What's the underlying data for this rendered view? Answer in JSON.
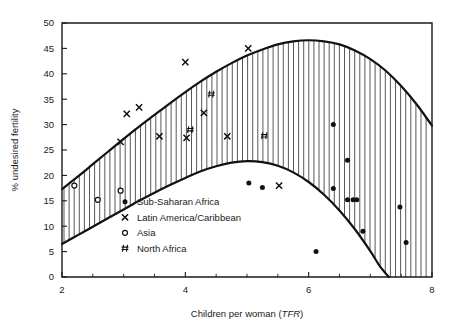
{
  "chart_data": {
    "type": "scatter",
    "title": "",
    "xlabel": "Children per woman (TFR)",
    "xlabel_plain": "Children per woman (",
    "xlabel_italic": "TFR",
    "xlabel_close": ")",
    "ylabel": "% undesired fertility",
    "xlim": [
      2,
      8
    ],
    "ylim": [
      0,
      50
    ],
    "xticks": [
      2,
      4,
      6,
      8
    ],
    "xticklabels": [
      "2",
      "4",
      "6",
      "8"
    ],
    "xminorticks": [
      2.5,
      3,
      3.5,
      4.5,
      5,
      5.5,
      6.5,
      7,
      7.5
    ],
    "yticks": [
      0,
      5,
      10,
      15,
      20,
      25,
      30,
      35,
      40,
      45,
      50
    ],
    "yticklabels": [
      "0",
      "5",
      "10",
      "15",
      "20",
      "25",
      "30",
      "35",
      "40",
      "45",
      "50"
    ],
    "grid": false,
    "legend_position": "inside-lower-left",
    "band": {
      "description": "Hatched band between an upper and a lower fitted curve of % undesired fertility vs TFR",
      "fill": "vertical-hatch",
      "upper_curve": [
        {
          "x": 2.0,
          "y": 17.3
        },
        {
          "x": 2.25,
          "y": 19.7
        },
        {
          "x": 2.5,
          "y": 22.2
        },
        {
          "x": 2.75,
          "y": 24.7
        },
        {
          "x": 3.0,
          "y": 27.2
        },
        {
          "x": 3.25,
          "y": 29.6
        },
        {
          "x": 3.5,
          "y": 31.9
        },
        {
          "x": 3.75,
          "y": 34.2
        },
        {
          "x": 4.0,
          "y": 36.4
        },
        {
          "x": 4.25,
          "y": 38.5
        },
        {
          "x": 4.5,
          "y": 40.4
        },
        {
          "x": 4.75,
          "y": 42.1
        },
        {
          "x": 5.0,
          "y": 43.6
        },
        {
          "x": 5.25,
          "y": 44.8
        },
        {
          "x": 5.5,
          "y": 45.8
        },
        {
          "x": 5.75,
          "y": 46.4
        },
        {
          "x": 6.0,
          "y": 46.6
        },
        {
          "x": 6.25,
          "y": 46.4
        },
        {
          "x": 6.5,
          "y": 45.8
        },
        {
          "x": 6.75,
          "y": 44.6
        },
        {
          "x": 7.0,
          "y": 42.9
        },
        {
          "x": 7.25,
          "y": 40.6
        },
        {
          "x": 7.5,
          "y": 37.6
        },
        {
          "x": 7.75,
          "y": 34.0
        },
        {
          "x": 8.0,
          "y": 29.8
        }
      ],
      "lower_curve": [
        {
          "x": 2.0,
          "y": 6.5
        },
        {
          "x": 2.25,
          "y": 8.2
        },
        {
          "x": 2.5,
          "y": 9.9
        },
        {
          "x": 2.75,
          "y": 11.6
        },
        {
          "x": 3.0,
          "y": 13.3
        },
        {
          "x": 3.25,
          "y": 15.0
        },
        {
          "x": 3.5,
          "y": 16.6
        },
        {
          "x": 3.75,
          "y": 18.1
        },
        {
          "x": 4.0,
          "y": 19.5
        },
        {
          "x": 4.25,
          "y": 20.8
        },
        {
          "x": 4.5,
          "y": 21.8
        },
        {
          "x": 4.75,
          "y": 22.5
        },
        {
          "x": 5.0,
          "y": 22.8
        },
        {
          "x": 5.25,
          "y": 22.6
        },
        {
          "x": 5.5,
          "y": 21.9
        },
        {
          "x": 5.75,
          "y": 20.6
        },
        {
          "x": 6.0,
          "y": 18.7
        },
        {
          "x": 6.25,
          "y": 16.2
        },
        {
          "x": 6.5,
          "y": 13.1
        },
        {
          "x": 6.75,
          "y": 9.4
        },
        {
          "x": 7.0,
          "y": 5.1
        },
        {
          "x": 7.15,
          "y": 2.2
        },
        {
          "x": 7.3,
          "y": 0.0
        }
      ]
    },
    "series": [
      {
        "name": "Sub-Saharan Africa",
        "marker": "filled-dot",
        "points": [
          {
            "x": 5.03,
            "y": 18.5
          },
          {
            "x": 5.25,
            "y": 17.6
          },
          {
            "x": 6.4,
            "y": 30.0
          },
          {
            "x": 6.4,
            "y": 17.4
          },
          {
            "x": 6.63,
            "y": 23.0
          },
          {
            "x": 6.63,
            "y": 15.2
          },
          {
            "x": 6.72,
            "y": 15.2
          },
          {
            "x": 6.78,
            "y": 15.2
          },
          {
            "x": 6.12,
            "y": 5.0
          },
          {
            "x": 6.88,
            "y": 9.0
          },
          {
            "x": 7.48,
            "y": 13.8
          },
          {
            "x": 7.58,
            "y": 6.8
          }
        ]
      },
      {
        "name": "Latin America/Caribbean",
        "marker": "x",
        "points": [
          {
            "x": 2.95,
            "y": 26.6
          },
          {
            "x": 3.05,
            "y": 32.1
          },
          {
            "x": 3.25,
            "y": 33.4
          },
          {
            "x": 3.58,
            "y": 27.7
          },
          {
            "x": 4.0,
            "y": 42.3
          },
          {
            "x": 4.02,
            "y": 27.4
          },
          {
            "x": 4.3,
            "y": 32.3
          },
          {
            "x": 4.68,
            "y": 27.7
          },
          {
            "x": 5.02,
            "y": 45.0
          },
          {
            "x": 5.52,
            "y": 18.0
          }
        ]
      },
      {
        "name": "Asia",
        "marker": "open-circle",
        "points": [
          {
            "x": 2.2,
            "y": 18.0
          },
          {
            "x": 2.58,
            "y": 15.2
          },
          {
            "x": 2.95,
            "y": 17.0
          }
        ]
      },
      {
        "name": "North Africa",
        "marker": "hash",
        "points": [
          {
            "x": 4.08,
            "y": 29.0
          },
          {
            "x": 4.42,
            "y": 36.0
          },
          {
            "x": 5.28,
            "y": 27.8
          }
        ]
      }
    ],
    "colors": {
      "ink": "#111111",
      "background": "#ffffff",
      "hatch": "#3a3a3a"
    }
  }
}
